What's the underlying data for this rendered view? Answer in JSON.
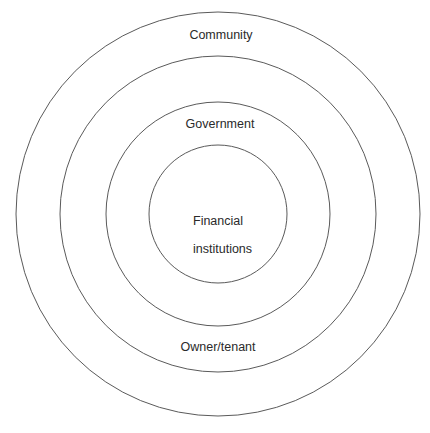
{
  "diagram": {
    "title": "",
    "type": "concentric-circles",
    "center": {
      "x": 218,
      "y": 214
    },
    "stroke_color": "#5a5a5a",
    "background_color": "#ffffff",
    "rings": [
      {
        "level": 1,
        "name": "outer",
        "radius": 202,
        "label": "Community"
      },
      {
        "level": 2,
        "name": "second",
        "radius": 158,
        "label": "Owner/tenant"
      },
      {
        "level": 3,
        "name": "third",
        "radius": 112,
        "label": "Government"
      },
      {
        "level": 4,
        "name": "inner",
        "radius": 69,
        "label": "Financial\ninstitutions"
      }
    ],
    "labels": {
      "community": "Community",
      "owner_tenant": "Owner/tenant",
      "government": "Government",
      "financial_line1": "Financial",
      "financial_line2": "institutions"
    }
  }
}
